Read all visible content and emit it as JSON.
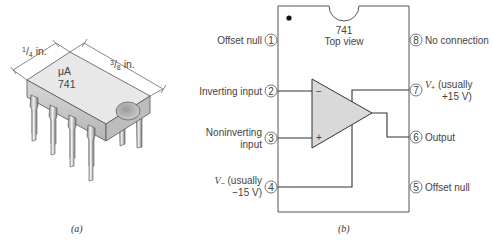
{
  "figure_a": {
    "caption": "(a)",
    "chip_label_line1": "μA",
    "chip_label_line2": "741",
    "width_dim": "1/4 in.",
    "width_dim_num": "1",
    "width_dim_den": "4",
    "width_dim_unit": " in.",
    "length_dim_num": "3",
    "length_dim_den": "8",
    "length_dim_unit": " in."
  },
  "figure_b": {
    "caption": "(b)",
    "title_line1": "741",
    "title_line2": "Top view",
    "pins": [
      {
        "number": "1",
        "label": "Offset null"
      },
      {
        "number": "2",
        "label": "Inverting input"
      },
      {
        "number": "3",
        "label_line1": "Noninverting",
        "label_line2": "input"
      },
      {
        "number": "4",
        "label_sym": "V",
        "label_sub": "−",
        "label_line1": " (usually",
        "label_line2": "−15 V)"
      },
      {
        "number": "5",
        "label": "Offset null"
      },
      {
        "number": "6",
        "label": "Output"
      },
      {
        "number": "7",
        "label_sym": "V",
        "label_sub": "+",
        "label_line1": " (usually",
        "label_line2": "+15 V)"
      },
      {
        "number": "8",
        "label": "No connection"
      }
    ],
    "opamp_minus": "−",
    "opamp_plus": "+"
  },
  "colors": {
    "line": "#333333",
    "opamp_fill": "#d9d9d9",
    "chip_top": "#e6e6e6",
    "chip_side": "#c8c8c8"
  }
}
